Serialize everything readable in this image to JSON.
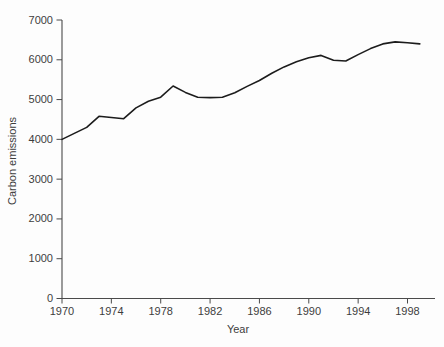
{
  "chart_data": {
    "type": "line",
    "title": "",
    "xlabel": "Year",
    "ylabel": "Carbon emissions",
    "x": [
      1970,
      1971,
      1972,
      1973,
      1974,
      1975,
      1976,
      1977,
      1978,
      1979,
      1980,
      1981,
      1982,
      1983,
      1984,
      1985,
      1986,
      1987,
      1988,
      1989,
      1990,
      1991,
      1992,
      1993,
      1994,
      1995,
      1996,
      1997,
      1998,
      1999
    ],
    "series": [
      {
        "name": "Carbon emissions",
        "values": [
          4000,
          4150,
          4300,
          4580,
          4550,
          4520,
          4790,
          4960,
          5060,
          5340,
          5180,
          5060,
          5050,
          5060,
          5170,
          5330,
          5480,
          5660,
          5820,
          5950,
          6050,
          6110,
          5990,
          5970,
          6130,
          6280,
          6400,
          6450,
          6430,
          6400
        ]
      }
    ],
    "x_ticks": [
      1970,
      1974,
      1978,
      1982,
      1986,
      1990,
      1994,
      1998
    ],
    "y_ticks": [
      0,
      1000,
      2000,
      3000,
      4000,
      5000,
      6000,
      7000
    ],
    "xlim": [
      1970,
      2000
    ],
    "ylim": [
      0,
      7000
    ],
    "grid": false,
    "legend": "none",
    "line_color": "#1c1c1c",
    "axis_color": "#4a4a4a",
    "text_color": "#3d3d3d"
  }
}
